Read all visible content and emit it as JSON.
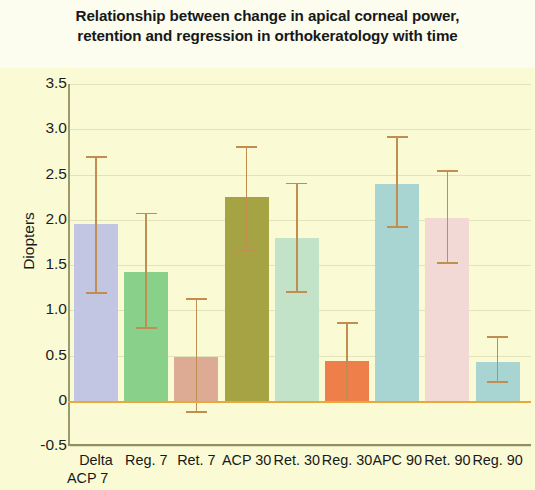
{
  "chart_data": {
    "type": "bar",
    "title": "Relationship between change in apical corneal power, retention and regression in orthokeratology with time",
    "title_lines": [
      "Relationship between change in apical corneal power,",
      "retention and regression in orthokeratology with time"
    ],
    "xlabel": "",
    "ylabel": "Diopters",
    "ylim": [
      -0.5,
      3.5
    ],
    "ytick_labels": [
      "3.5",
      "3.0",
      "2.5",
      "2.0",
      "1.5",
      "1.0",
      "0.5",
      "0",
      "-0.5"
    ],
    "ytick_values": [
      3.5,
      3.0,
      2.5,
      2.0,
      1.5,
      1.0,
      0.5,
      0,
      -0.5
    ],
    "grid": true,
    "legend": false,
    "categories": [
      "Delta ACP 7",
      "Reg. 7",
      "Ret. 7",
      "ACP 30",
      "Ret. 30",
      "Reg. 30",
      "APC 90",
      "Ret. 90",
      "Reg. 90"
    ],
    "category_label_lines": [
      [
        "Delta",
        "ACP 7"
      ],
      [
        "Reg. 7",
        ""
      ],
      [
        "Ret. 7",
        ""
      ],
      [
        "ACP 30",
        ""
      ],
      [
        "Ret. 30",
        ""
      ],
      [
        "Reg. 30",
        ""
      ],
      [
        "APC 90",
        ""
      ],
      [
        "Ret. 90",
        ""
      ],
      [
        "Reg. 90",
        ""
      ]
    ],
    "values": [
      1.95,
      1.42,
      0.49,
      2.25,
      1.8,
      0.44,
      2.4,
      2.02,
      0.43
    ],
    "error_upper": [
      2.7,
      2.08,
      1.14,
      2.81,
      2.41,
      0.87,
      2.92,
      2.55,
      0.72
    ],
    "error_lower": [
      1.2,
      0.82,
      -0.11,
      1.67,
      1.21,
      0.0,
      1.93,
      1.53,
      0.22
    ],
    "bar_colors": [
      "#c3c6e3",
      "#89d18b",
      "#ddaa94",
      "#a7a martial",
      "#c3e3c9",
      "#ef7f4a",
      "#a8d4d2",
      "#f3d9d5",
      "#a8d4d2"
    ],
    "bar_colors_fixed": [
      "#c3c6e3",
      "#89d18b",
      "#ddaa94",
      "#a6a345",
      "#c3e3c9",
      "#ef7f4a",
      "#a8d4d2",
      "#f3d9d5",
      "#a8d4d2"
    ],
    "errorbar_color": "#c08e50",
    "zero_line_color": "#e8a93c",
    "plot_background": "#fafbd4",
    "page_background": "#fdfdef",
    "axis_color": "#8f8f63"
  }
}
